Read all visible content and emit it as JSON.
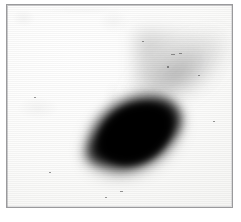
{
  "figure": {
    "kind": "photographic-plate-scan",
    "caption": "",
    "width_px": 241,
    "height_px": 222,
    "page_background": "#ffffff"
  },
  "frame": {
    "name": "plate border",
    "border_color": "#9a9a9c",
    "border_width_px": 1,
    "left_px": 6,
    "top_px": 4,
    "width_px": 227,
    "height_px": 204,
    "fill_color": "#fbfbfa"
  },
  "field": {
    "name": "emulsion field",
    "background_color": "#fcfcfb",
    "texture": "horizontal-scanlines",
    "noise_color": "#464646"
  },
  "objects": [
    {
      "id": "nucleus",
      "name": "central dark blob",
      "shape": "elongated-ovoid",
      "core_color": "#000000",
      "center_x_px": 124,
      "center_y_px": 133,
      "major_axis_px": 104,
      "minor_axis_px": 74,
      "rotation_deg": -30,
      "opacity": 1.0
    },
    {
      "id": "tail",
      "name": "lower-left pointed tail",
      "shape": "tapered-lobe",
      "core_color": "#0a0a0a",
      "center_x_px": 92,
      "center_y_px": 151,
      "rotation_deg": -32,
      "opacity": 0.9
    },
    {
      "id": "plume",
      "name": "faint upper-right plume",
      "shape": "diffuse-streak",
      "core_color": "#3c3c3c",
      "center_x_px": 171,
      "center_y_px": 69,
      "rotation_deg": -34,
      "opacity": 0.3
    }
  ],
  "specks": [
    {
      "x_px": 170,
      "y_px": 53,
      "w_px": 4,
      "h_px": 1
    },
    {
      "x_px": 178,
      "y_px": 52,
      "w_px": 3,
      "h_px": 1
    },
    {
      "x_px": 166,
      "y_px": 65,
      "w_px": 2,
      "h_px": 2
    },
    {
      "x_px": 197,
      "y_px": 74,
      "w_px": 2,
      "h_px": 1
    },
    {
      "x_px": 141,
      "y_px": 40,
      "w_px": 2,
      "h_px": 1
    },
    {
      "x_px": 119,
      "y_px": 190,
      "w_px": 3,
      "h_px": 1
    },
    {
      "x_px": 104,
      "y_px": 196,
      "w_px": 2,
      "h_px": 1
    },
    {
      "x_px": 48,
      "y_px": 171,
      "w_px": 2,
      "h_px": 1
    },
    {
      "x_px": 212,
      "y_px": 120,
      "w_px": 2,
      "h_px": 1
    },
    {
      "x_px": 33,
      "y_px": 96,
      "w_px": 2,
      "h_px": 1
    }
  ]
}
